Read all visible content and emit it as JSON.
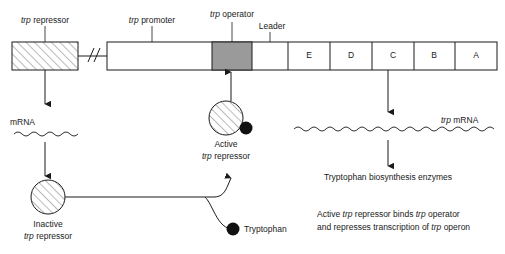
{
  "diagram": {
    "colors": {
      "stroke": "#1a1a1a",
      "operator_fill": "#9a9a9a",
      "hatch": "#555555",
      "dot_fill": "#111111",
      "box_fill": "#ffffff"
    },
    "gene_map": {
      "repressor_gene_label_italic": "trp",
      "repressor_gene_label_rest": " repressor",
      "promoter_label_italic": "trp",
      "promoter_label_rest": " promoter",
      "operator_label_italic": "trp",
      "operator_label_rest": " operator",
      "leader_label": "Leader",
      "structural_genes": [
        "E",
        "D",
        "C",
        "B",
        "A"
      ]
    },
    "left_branch": {
      "mrna_label": "mRNA",
      "inactive_line1": "Inactive",
      "inactive_line2_italic": "trp",
      "inactive_line2_rest": " repressor"
    },
    "center_branch": {
      "active_line1": "Active",
      "active_line2_italic": "trp",
      "active_line2_rest": " repressor",
      "tryptophan_label": "Tryptophan"
    },
    "right_branch": {
      "trp_mrna_italic": "trp",
      "trp_mrna_rest": " mRNA",
      "enzymes_label": "Tryptophan biosynthesis enzymes",
      "caption_line1_a": "Active ",
      "caption_line1_b": "trp",
      "caption_line1_c": " repressor binds ",
      "caption_line1_d": "trp",
      "caption_line1_e": " operator",
      "caption_line2_a": "and represses transcription of ",
      "caption_line2_b": "trp",
      "caption_line2_c": " operon"
    }
  }
}
